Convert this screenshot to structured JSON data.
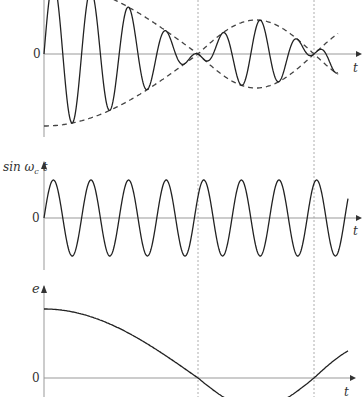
{
  "figure": {
    "panels": [
      {
        "id": "am-signal",
        "zero_label": "0",
        "x_label": "t",
        "y_label": ""
      },
      {
        "id": "carrier",
        "zero_label": "0",
        "x_label": "t",
        "y_label": "sin ω",
        "y_label_sub": "c",
        "y_label_tail": " t"
      },
      {
        "id": "envelope-error",
        "zero_label": "0",
        "x_label": "t",
        "y_label": "e"
      }
    ],
    "guide_lines": "dashed vertical lines at envelope nulls"
  },
  "chart_data": [
    {
      "type": "line",
      "title": "Modulated signal with dashed envelope",
      "xlabel": "t",
      "ylabel": "",
      "series": [
        {
          "name": "modulated carrier",
          "style": "solid"
        },
        {
          "name": "upper/lower envelope",
          "style": "dashed"
        }
      ],
      "notes": "Envelope |cos| shape: amplitude decreasing to null at first dashed line, rising to max then null at second dashed line"
    },
    {
      "type": "line",
      "title": "Carrier",
      "xlabel": "t",
      "ylabel": "sin ω_c t",
      "series": [
        {
          "name": "sin ω_c t",
          "style": "solid",
          "cycles_visible": 8
        }
      ]
    },
    {
      "type": "line",
      "title": "Error signal",
      "xlabel": "t",
      "ylabel": "e",
      "series": [
        {
          "name": "e",
          "style": "solid",
          "shape": "cosine, crosses zero at dashed lines"
        }
      ]
    }
  ]
}
